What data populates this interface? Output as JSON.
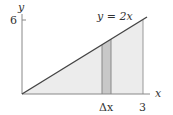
{
  "diagram": {
    "y_axis_label": "y",
    "x_axis_label": "x",
    "y_tick_label": "6",
    "x_tick_label": "3",
    "curve_label": "y = 2x",
    "strip_label": "Δx",
    "colors": {
      "region_fill": "#ececec",
      "strip_fill": "#c8c8c8",
      "line": "#444444",
      "axis": "#888888"
    }
  }
}
